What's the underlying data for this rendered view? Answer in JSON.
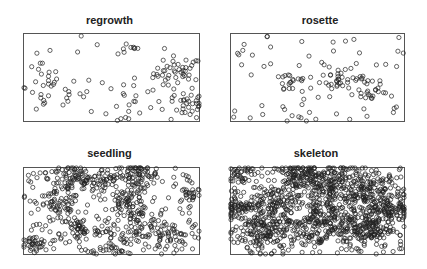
{
  "chart_data": {
    "type": "scatter",
    "layout": "2x2 small multiples of spatial point patterns",
    "axes_shown": false,
    "grid": false,
    "legend": null,
    "marker": "open circle",
    "panels": [
      {
        "title": "regrowth",
        "approx_points": 150,
        "pattern": "sparse, clustered at right side and lower-left",
        "clusters": [
          {
            "x": 0.88,
            "y": 0.55,
            "spread": 0.07,
            "n": 45
          },
          {
            "x": 0.95,
            "y": 0.18,
            "spread": 0.05,
            "n": 25
          },
          {
            "x": 0.15,
            "y": 0.35,
            "spread": 0.09,
            "n": 30
          },
          {
            "x": 0.62,
            "y": 0.25,
            "spread": 0.08,
            "n": 15
          },
          {
            "x": 0.6,
            "y": 0.85,
            "spread": 0.04,
            "n": 6
          }
        ],
        "background_points": 30
      },
      {
        "title": "rosette",
        "approx_points": 140,
        "pattern": "sparse, small clusters in middle band",
        "clusters": [
          {
            "x": 0.35,
            "y": 0.45,
            "spread": 0.05,
            "n": 18
          },
          {
            "x": 0.62,
            "y": 0.5,
            "spread": 0.05,
            "n": 18
          },
          {
            "x": 0.75,
            "y": 0.45,
            "spread": 0.05,
            "n": 16
          },
          {
            "x": 0.82,
            "y": 0.3,
            "spread": 0.05,
            "n": 16
          },
          {
            "x": 0.4,
            "y": 0.05,
            "spread": 0.05,
            "n": 8
          }
        ],
        "background_points": 60
      },
      {
        "title": "seedling",
        "approx_points": 700,
        "pattern": "dense, many clusters throughout",
        "clusters": [
          {
            "x": 0.65,
            "y": 0.92,
            "spread": 0.06,
            "n": 70
          },
          {
            "x": 0.28,
            "y": 0.88,
            "spread": 0.07,
            "n": 60
          },
          {
            "x": 0.2,
            "y": 0.55,
            "spread": 0.06,
            "n": 50
          },
          {
            "x": 0.6,
            "y": 0.6,
            "spread": 0.06,
            "n": 55
          },
          {
            "x": 0.65,
            "y": 0.35,
            "spread": 0.06,
            "n": 45
          },
          {
            "x": 0.82,
            "y": 0.2,
            "spread": 0.06,
            "n": 50
          },
          {
            "x": 0.05,
            "y": 0.1,
            "spread": 0.04,
            "n": 30
          },
          {
            "x": 0.32,
            "y": 0.3,
            "spread": 0.05,
            "n": 40
          },
          {
            "x": 0.95,
            "y": 0.7,
            "spread": 0.04,
            "n": 25
          },
          {
            "x": 0.45,
            "y": 0.85,
            "spread": 0.05,
            "n": 35
          },
          {
            "x": 0.5,
            "y": 0.15,
            "spread": 0.06,
            "n": 35
          }
        ],
        "background_points": 200
      },
      {
        "title": "skeleton",
        "approx_points": 1400,
        "pattern": "very dense, continuous clusters with gaps at upper-left and center",
        "clusters": [
          {
            "x": 0.55,
            "y": 0.8,
            "spread": 0.1,
            "n": 180
          },
          {
            "x": 0.8,
            "y": 0.7,
            "spread": 0.1,
            "n": 170
          },
          {
            "x": 0.2,
            "y": 0.25,
            "spread": 0.09,
            "n": 150
          },
          {
            "x": 0.25,
            "y": 0.6,
            "spread": 0.07,
            "n": 90
          },
          {
            "x": 0.5,
            "y": 0.35,
            "spread": 0.1,
            "n": 170
          },
          {
            "x": 0.78,
            "y": 0.3,
            "spread": 0.08,
            "n": 140
          },
          {
            "x": 0.92,
            "y": 0.5,
            "spread": 0.06,
            "n": 80
          },
          {
            "x": 0.05,
            "y": 0.55,
            "spread": 0.05,
            "n": 60
          },
          {
            "x": 0.38,
            "y": 0.92,
            "spread": 0.06,
            "n": 70
          },
          {
            "x": 0.05,
            "y": 0.95,
            "spread": 0.04,
            "n": 30
          }
        ],
        "background_points": 250
      }
    ]
  }
}
